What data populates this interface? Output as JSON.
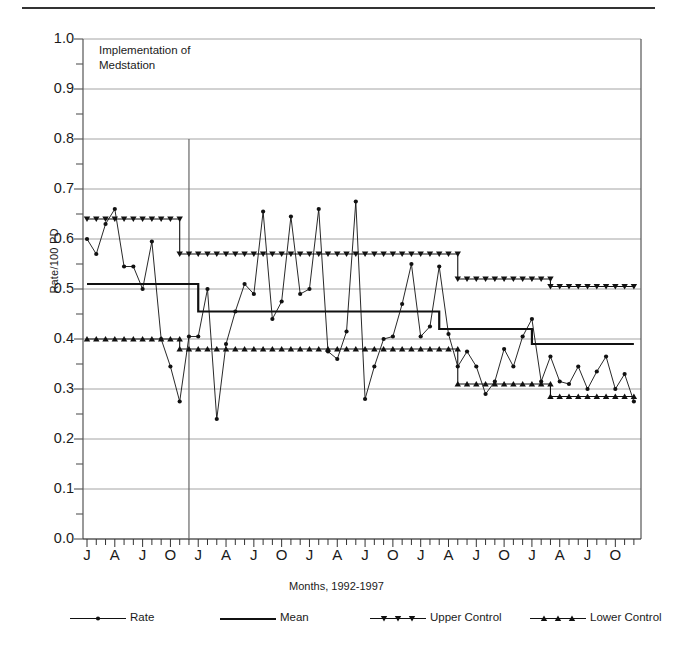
{
  "figure": {
    "ylabel": "Rate/100 PD",
    "xlabel": "Months, 1992-1997",
    "annotation_line1": "Implementation of",
    "annotation_line2": "Medstation"
  },
  "legend": {
    "items": [
      {
        "label": "Rate",
        "marker": "circle",
        "style": "line-marker"
      },
      {
        "label": "Mean",
        "marker": "none",
        "style": "thick-line"
      },
      {
        "label": "Upper Control",
        "marker": "triangle-down",
        "style": "line-marker"
      },
      {
        "label": "Lower Control",
        "marker": "triangle-up",
        "style": "line-marker"
      }
    ]
  },
  "axis": {
    "y_ticks": [
      "1.0",
      "0.9",
      "0.8",
      "0.7",
      "0.6",
      "0.5",
      "0.4",
      "0.3",
      "0.2",
      "0.1",
      "0.0"
    ],
    "x_ticks": [
      "J",
      "A",
      "J",
      "O",
      "J",
      "A",
      "J",
      "O",
      "J",
      "A",
      "J",
      "O",
      "J",
      "A",
      "J",
      "O",
      "J",
      "A",
      "J",
      "O",
      "J",
      "A",
      "J",
      "O",
      "J",
      "A",
      "J",
      "O"
    ]
  },
  "chart_data": {
    "type": "line",
    "title": "",
    "xlabel": "Months, 1992-1997",
    "ylabel": "Rate/100 PD",
    "ylim": [
      0.0,
      1.0
    ],
    "ytick_values": [
      0.0,
      0.1,
      0.2,
      0.3,
      0.4,
      0.5,
      0.6,
      0.7,
      0.8,
      0.9,
      1.0
    ],
    "minor_ticks": true,
    "grid": "horizontal-major",
    "x_labels": [
      "J",
      "A",
      "J",
      "O",
      "J",
      "A",
      "J",
      "O",
      "J",
      "A",
      "J",
      "O",
      "J",
      "A",
      "J",
      "O",
      "J",
      "A",
      "J",
      "O",
      "J",
      "A",
      "J",
      "O",
      "J",
      "A",
      "J",
      "O"
    ],
    "x_label_interval_months": 3,
    "x_count": 60,
    "annotations": [
      {
        "text": "Implementation of Medstation",
        "type": "vertical-line",
        "x_index": 11,
        "y_from": 0.8,
        "y_to": 0.0
      }
    ],
    "series": [
      {
        "name": "Rate",
        "marker": "circle",
        "values": [
          0.6,
          0.57,
          0.63,
          0.66,
          0.545,
          0.545,
          0.5,
          0.595,
          0.4,
          0.345,
          0.275,
          0.405,
          0.405,
          0.5,
          0.24,
          0.39,
          0.455,
          0.51,
          0.49,
          0.655,
          0.44,
          0.475,
          0.645,
          0.49,
          0.5,
          0.66,
          0.375,
          0.36,
          0.415,
          0.675,
          0.28,
          0.345,
          0.4,
          0.405,
          0.47,
          0.55,
          0.405,
          0.425,
          0.545,
          0.41,
          0.345,
          0.375,
          0.345,
          0.29,
          0.315,
          0.38,
          0.345,
          0.405,
          0.44,
          0.315,
          0.365,
          0.315,
          0.31,
          0.345,
          0.3,
          0.335,
          0.365,
          0.3,
          0.33,
          0.275
        ]
      },
      {
        "name": "Mean",
        "marker": "none",
        "type": "step",
        "segments": [
          {
            "x_start": 0,
            "x_end": 10,
            "value": 0.51
          },
          {
            "x_start": 10,
            "x_end": 12,
            "value": 0.51
          },
          {
            "x_start": 12,
            "x_end": 38,
            "value": 0.455
          },
          {
            "x_start": 38,
            "x_end": 48,
            "value": 0.42
          },
          {
            "x_start": 48,
            "x_end": 59,
            "value": 0.39
          }
        ]
      },
      {
        "name": "Upper Control",
        "marker": "triangle-down",
        "type": "step",
        "segments": [
          {
            "x_start": 0,
            "x_end": 10,
            "value": 0.64
          },
          {
            "x_start": 10,
            "x_end": 40,
            "value": 0.57
          },
          {
            "x_start": 40,
            "x_end": 50,
            "value": 0.52
          },
          {
            "x_start": 50,
            "x_end": 59,
            "value": 0.505
          }
        ]
      },
      {
        "name": "Lower Control",
        "marker": "triangle-up",
        "type": "step",
        "segments": [
          {
            "x_start": 0,
            "x_end": 10,
            "value": 0.4
          },
          {
            "x_start": 10,
            "x_end": 40,
            "value": 0.38
          },
          {
            "x_start": 40,
            "x_end": 50,
            "value": 0.31
          },
          {
            "x_start": 50,
            "x_end": 59,
            "value": 0.285
          }
        ]
      }
    ]
  }
}
